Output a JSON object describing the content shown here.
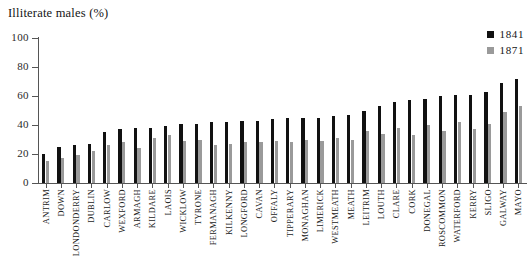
{
  "chart_data": {
    "type": "bar",
    "title": "Illiterate males (%)",
    "xlabel": "",
    "ylabel": "",
    "ylim": [
      0,
      100
    ],
    "yticks": [
      0,
      20,
      40,
      60,
      80,
      100
    ],
    "grid": false,
    "legend_position": "top-right",
    "categories": [
      "ANTRIM",
      "DOWN",
      "LONDONDERRY",
      "DUBLIN",
      "CARLOW",
      "WEXFORD",
      "ARMAGH",
      "KILDARE",
      "LAOIS",
      "WICKLOW",
      "TYRONE",
      "FERMANAGH",
      "KILKENNY",
      "LONGFORD",
      "CAVAN",
      "OFFALY",
      "TIPPERARY",
      "MONAGHAN",
      "LIMERICK",
      "WESTMEATH",
      "MEATH",
      "LEITRIM",
      "LOUTH",
      "CLARE",
      "CORK",
      "DONEGAL",
      "ROSCOMMON",
      "WATERFORD",
      "KERRY",
      "SLIGO",
      "GALWAY",
      "MAYO"
    ],
    "series": [
      {
        "name": "1841",
        "color": "#111111",
        "values": [
          20,
          25,
          26,
          27,
          35,
          37,
          38,
          38,
          39,
          41,
          41,
          42,
          42,
          43,
          43,
          44,
          45,
          45,
          45,
          46,
          47,
          50,
          53,
          56,
          57,
          58,
          60,
          61,
          61,
          63,
          69,
          72
        ]
      },
      {
        "name": "1871",
        "color": "#9a9a9a",
        "values": [
          15,
          17,
          19,
          22,
          26,
          28,
          24,
          31,
          33,
          29,
          30,
          26,
          27,
          28,
          28,
          29,
          28,
          30,
          29,
          31,
          30,
          36,
          34,
          38,
          33,
          40,
          36,
          42,
          37,
          41,
          49,
          53
        ]
      }
    ]
  },
  "legend": {
    "items": [
      {
        "label": "1841",
        "color": "#111111"
      },
      {
        "label": "1871",
        "color": "#9a9a9a"
      }
    ]
  }
}
